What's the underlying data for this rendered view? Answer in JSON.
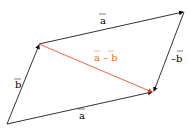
{
  "diagram": {
    "labels": {
      "a_top": "a",
      "a_bottom": "a",
      "b_left": "b",
      "neg_b": "–b",
      "a_minus_b": "a – b"
    },
    "colors": {
      "vector": "#000000",
      "difference": "#e8401c",
      "difference_label": "#e8701c"
    },
    "points": {
      "origin": [
        7,
        124
      ],
      "b_tip": [
        39,
        44
      ],
      "a_plus_b": [
        184,
        12
      ],
      "a_tip": [
        153,
        92
      ]
    }
  }
}
